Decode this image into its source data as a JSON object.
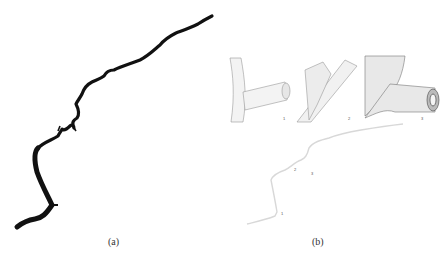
{
  "figure": {
    "panels": [
      {
        "id": "a",
        "caption": "(a)",
        "description": "Vessel centerline rendered as thick black tortuous curve"
      },
      {
        "id": "b",
        "caption": "(b)",
        "description": "3D surface mesh close-ups of branch junctions with overview vessel",
        "insets": [
          {
            "label": "1",
            "description": "Side branch junction, smooth surface"
          },
          {
            "label": "2",
            "description": "Bifurcation with diagonal vessel"
          },
          {
            "label": "3",
            "description": "Branch with contour-lined surface and open lumen"
          }
        ],
        "overview_markers": [
          "1",
          "2",
          "3"
        ]
      }
    ],
    "colors": {
      "curve": "#111111",
      "mesh_stroke": "#8a8a8a",
      "overview": "#d8d8d8"
    }
  }
}
